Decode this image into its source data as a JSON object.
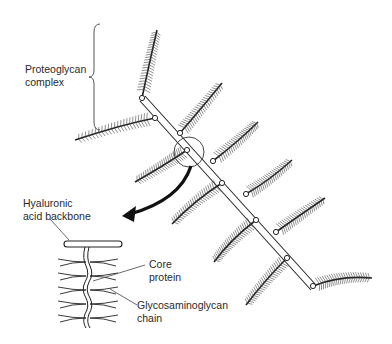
{
  "labels": {
    "proteoglycan": [
      "Proteoglycan",
      "complex"
    ],
    "hyaluronic": [
      "Hyaluronic",
      "acid backbone"
    ],
    "core": [
      "Core",
      "protein"
    ],
    "gag": [
      "Glycosaminoglycan",
      "chain"
    ]
  },
  "colors": {
    "ink": "#2a2a2a",
    "background": "#ffffff"
  }
}
